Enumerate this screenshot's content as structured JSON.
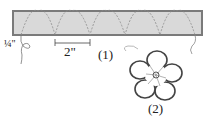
{
  "diagram": {
    "strip": {
      "fill": "#d9d9d9",
      "border": "#7a7a7a",
      "scallop_color": "#8a8a8a"
    },
    "labels": {
      "seam_allowance": "¼\"",
      "spacing": "2\"",
      "step1": "(1)",
      "step2": "(2)"
    }
  }
}
